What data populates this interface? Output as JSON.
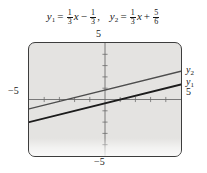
{
  "figure": {
    "caption": {
      "equation1": {
        "lhs": "y",
        "lhs_sub": "1",
        "equals": "=",
        "coef_num": "1",
        "coef_den": "3",
        "x": "x",
        "operator": "−",
        "const_num": "1",
        "const_den": "3",
        "trailing": ",",
        "plain": "y1 = (1/3)x − 1/3"
      },
      "equation2": {
        "lhs": "y",
        "lhs_sub": "2",
        "equals": "=",
        "coef_num": "1",
        "coef_den": "3",
        "x": "x",
        "operator": "+",
        "const_num": "5",
        "const_den": "6",
        "plain": "y2 = (1/3)x + 5/6"
      }
    },
    "screen": {
      "background_color": "#e4e3e1",
      "border_color": "#3d3d3d",
      "axis_color": "#6b6b6b",
      "labels": {
        "top": "5",
        "bottom": "−5",
        "left": "−5",
        "right": "5",
        "curve_upper": "y",
        "curve_upper_sub": "2",
        "curve_lower": "y",
        "curve_lower_sub": "1"
      }
    }
  },
  "chart_data": {
    "type": "line",
    "title": "",
    "xlabel": "",
    "ylabel": "",
    "xlim": [
      -5,
      5
    ],
    "ylim": [
      -5,
      5
    ],
    "xticks": [
      -4,
      -3,
      -2,
      -1,
      1,
      2,
      3,
      4
    ],
    "yticks": [
      -4,
      -3,
      -2,
      -1,
      1,
      2,
      3,
      4
    ],
    "grid": false,
    "legend": "right-edge-inline",
    "axis_tick_step": 1,
    "series": [
      {
        "name": "y₂",
        "label": "y2",
        "expression": "y = (1/3)x + 5/6",
        "slope": 0.3333,
        "intercept": 0.8333,
        "color": "#4d4d4d",
        "linewidth": 1.4,
        "x": [
          -5,
          5
        ],
        "y": [
          -0.8333,
          2.5
        ]
      },
      {
        "name": "y₁",
        "label": "y1",
        "expression": "y = (1/3)x − 1/3",
        "slope": 0.3333,
        "intercept": -0.3333,
        "color": "#1c1c1c",
        "linewidth": 1.9,
        "x": [
          -5,
          5
        ],
        "y": [
          -2.0,
          1.3333
        ]
      }
    ]
  }
}
